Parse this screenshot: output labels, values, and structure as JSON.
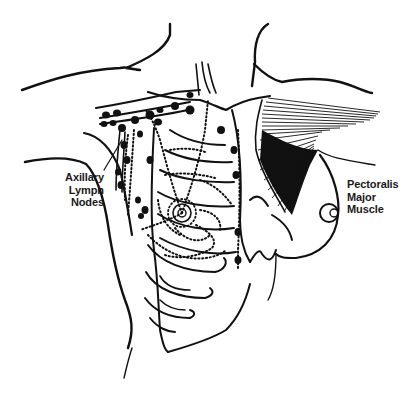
{
  "diagram": {
    "type": "anatomical-illustration",
    "colors": {
      "ink": "#111111",
      "background": "#ffffff"
    },
    "labels": {
      "axillary_lymph_nodes": {
        "line1": "Axillary",
        "line2": "Lymph",
        "line3": "Nodes"
      },
      "pectoralis_major_muscle": {
        "line1": "Pectoralis",
        "line2": "Major",
        "line3": "Muscle"
      }
    },
    "structures": [
      "neck-and-shoulders-outline",
      "clavicle",
      "rib-cage",
      "sternum",
      "axillary-lymph-nodes",
      "internal-mammary-lymph-nodes",
      "lymphatic-vessels",
      "breast-with-areola",
      "pectoralis-major-muscle",
      "right-breast-nipple"
    ]
  }
}
